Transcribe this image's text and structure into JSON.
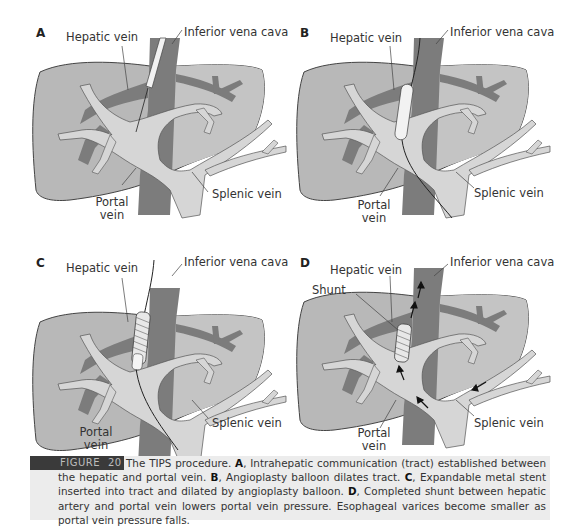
{
  "colors": {
    "liver": "#b8b8b8",
    "liver_outline": "#444444",
    "ivc_hepatic": "#7c7c7c",
    "portal": "#d6d6d6",
    "stent": "#e8e8e8",
    "caption_bg": "#ececec",
    "figure_tag_bg": "#3a3a3a"
  },
  "panels": [
    {
      "letter": "A",
      "labels": {
        "hepatic_vein": "Hepatic vein",
        "ivc": "Inferior vena cava",
        "portal_vein_1": "Portal",
        "portal_vein_2": "vein",
        "splenic_vein": "Splenic vein"
      }
    },
    {
      "letter": "B",
      "labels": {
        "hepatic_vein": "Hepatic vein",
        "ivc": "Inferior vena cava",
        "portal_vein_1": "Portal",
        "portal_vein_2": "vein",
        "splenic_vein": "Splenic vein"
      }
    },
    {
      "letter": "C",
      "labels": {
        "hepatic_vein": "Hepatic vein",
        "ivc": "Inferior vena cava",
        "portal_vein_1": "Portal",
        "portal_vein_2": "vein",
        "splenic_vein": "Splenic vein"
      }
    },
    {
      "letter": "D",
      "labels": {
        "hepatic_vein": "Hepatic vein",
        "ivc": "Inferior vena cava",
        "shunt": "Shunt",
        "portal_vein_1": "Portal",
        "portal_vein_2": "vein",
        "splenic_vein": "Splenic vein"
      }
    }
  ],
  "caption": {
    "tag_word": "FIGURE",
    "tag_number": "20",
    "intro": "The TIPS procedure. ",
    "a_label": "A",
    "a_text": ", Intrahepatic communication (tract) established between the hepatic and portal vein. ",
    "b_label": "B",
    "b_text": ", Angioplasty balloon dilates tract. ",
    "c_label": "C",
    "c_text": ", Expandable metal stent inserted into tract and dilated by angioplasty balloon. ",
    "d_label": "D",
    "d_text": ", Completed shunt between hepatic artery and portal vein lowers portal vein pressure. Esophageal varices become smaller as portal vein pressure falls."
  }
}
